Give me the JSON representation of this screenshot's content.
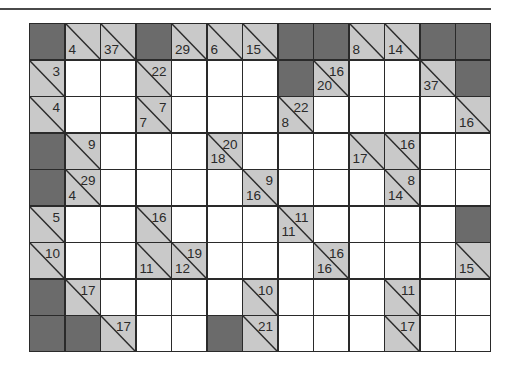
{
  "puzzle": {
    "type": "kakuro",
    "rows": 9,
    "cols": 13,
    "colors": {
      "block": "#6b6b6b",
      "clue": "#c9c9c9",
      "white": "#ffffff",
      "line": "#2a2a2a"
    },
    "grid": [
      [
        "B",
        {
          "d": 4
        },
        {
          "d": 37
        },
        "B",
        {
          "d": 29
        },
        {
          "d": 6
        },
        {
          "d": 15
        },
        "B",
        "B",
        {
          "d": 8
        },
        {
          "d": 14
        },
        "B",
        "B"
      ],
      [
        {
          "r": 3
        },
        "W",
        "W",
        {
          "r": 22
        },
        "W",
        "W",
        "W",
        "B",
        {
          "r": 16,
          "d": 20
        },
        "W",
        "W",
        {
          "d": 37
        },
        "B"
      ],
      [
        {
          "r": 4
        },
        "W",
        "W",
        {
          "r": 7,
          "d": 7
        },
        "W",
        "W",
        "W",
        {
          "r": 22,
          "d": 8
        },
        "W",
        "W",
        "W",
        "W",
        {
          "d": 16
        }
      ],
      [
        "B",
        {
          "r": 9
        },
        "W",
        "W",
        "W",
        {
          "r": 20,
          "d": 18
        },
        "W",
        "W",
        "W",
        {
          "d": 17
        },
        {
          "r": 16
        },
        "W",
        "W"
      ],
      [
        "B",
        {
          "r": 29,
          "d": 4
        },
        "W",
        "W",
        "W",
        "W",
        {
          "r": 9,
          "d": 16
        },
        "W",
        "W",
        "W",
        {
          "r": 8,
          "d": 14
        },
        "W",
        "W"
      ],
      [
        {
          "r": 5
        },
        "W",
        "W",
        {
          "r": 16
        },
        "W",
        "W",
        "W",
        {
          "r": 11,
          "d": 11
        },
        "W",
        "W",
        "W",
        "W",
        "B"
      ],
      [
        {
          "r": 10
        },
        "W",
        "W",
        {
          "d": 11
        },
        {
          "r": 19,
          "d": 12
        },
        "W",
        "W",
        "W",
        {
          "r": 16,
          "d": 16
        },
        "W",
        "W",
        "W",
        {
          "d": 15
        }
      ],
      [
        "B",
        {
          "r": 17
        },
        "W",
        "W",
        "W",
        "W",
        {
          "r": 10
        },
        "W",
        "W",
        "W",
        {
          "r": 11
        },
        "W",
        "W"
      ],
      [
        "B",
        "B",
        {
          "r": 17
        },
        "W",
        "W",
        "B",
        {
          "r": 21
        },
        "W",
        "W",
        "W",
        {
          "r": 17
        },
        "W",
        "W"
      ]
    ]
  }
}
